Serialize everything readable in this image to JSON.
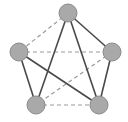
{
  "diagram": {
    "type": "graph",
    "colors": {
      "node_fill": "#a9a9a9",
      "node_stroke": "#8a8a8a",
      "solid_edge": "#4a4a4a",
      "dashed_edge": "#9a9a9a",
      "background": "#ffffff"
    },
    "nodes": [
      {
        "id": "top",
        "x": 68,
        "y": 13,
        "r": 9
      },
      {
        "id": "left",
        "x": 19,
        "y": 52,
        "r": 9
      },
      {
        "id": "right",
        "x": 112,
        "y": 52,
        "r": 9
      },
      {
        "id": "bottom-left",
        "x": 36,
        "y": 105,
        "r": 9
      },
      {
        "id": "bottom-right",
        "x": 99,
        "y": 105,
        "r": 9
      }
    ],
    "edges": [
      {
        "from": "top",
        "to": "right",
        "style": "solid"
      },
      {
        "from": "top",
        "to": "bottom-left",
        "style": "solid"
      },
      {
        "from": "top",
        "to": "bottom-right",
        "style": "solid"
      },
      {
        "from": "left",
        "to": "bottom-left",
        "style": "solid"
      },
      {
        "from": "left",
        "to": "bottom-right",
        "style": "solid"
      },
      {
        "from": "right",
        "to": "bottom-right",
        "style": "solid"
      },
      {
        "from": "top",
        "to": "left",
        "style": "dashed"
      },
      {
        "from": "left",
        "to": "right",
        "style": "dashed"
      },
      {
        "from": "right",
        "to": "bottom-left",
        "style": "dashed"
      },
      {
        "from": "bottom-left",
        "to": "bottom-right",
        "style": "dashed"
      }
    ]
  }
}
